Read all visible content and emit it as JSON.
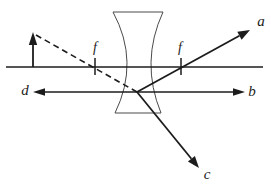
{
  "figure": {
    "labels": {
      "ray_a": "a",
      "ray_b": "b",
      "ray_c": "c",
      "ray_d": "d",
      "focal_left": "f",
      "focal_right": "f"
    },
    "colors": {
      "background": "#ffffff",
      "line": "#1c1c1c",
      "lens_outline": "#4a4a4a"
    }
  }
}
